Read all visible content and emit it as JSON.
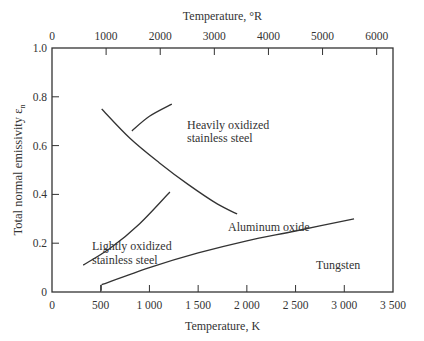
{
  "chart_data": {
    "type": "line",
    "title": "",
    "xlabel": "Temperature, K",
    "x2label": "Temperature, °R",
    "ylabel": "Total normal emissivity ε",
    "ylabel_sub": "n",
    "xlim": [
      0,
      3500
    ],
    "x2lim": [
      0,
      6300
    ],
    "ylim": [
      0,
      1.0
    ],
    "x_ticks": [
      0,
      500,
      1000,
      1500,
      2000,
      2500,
      3000,
      3500
    ],
    "x_tick_labels": [
      "0",
      "500",
      "1 000",
      "1 500",
      "2 000",
      "2 500",
      "3 000",
      "3 500"
    ],
    "x2_ticks": [
      0,
      1000,
      2000,
      3000,
      4000,
      5000,
      6000
    ],
    "x2_tick_labels": [
      "0",
      "1000",
      "2000",
      "3000",
      "4000",
      "5000",
      "6000"
    ],
    "y_ticks": [
      0,
      0.2,
      0.4,
      0.6,
      0.8,
      1.0
    ],
    "y_tick_labels": [
      "0",
      "0.2",
      "0.4",
      "0.6",
      "0.8",
      "1.0"
    ],
    "grid": false,
    "legend": "inline labels",
    "series": [
      {
        "name": "Aluminum oxide",
        "x": [
          510,
          800,
          1100,
          1400,
          1700,
          1900
        ],
        "y": [
          0.75,
          0.63,
          0.53,
          0.44,
          0.36,
          0.32
        ]
      },
      {
        "name": "Heavily oxidized stainless steel",
        "x": [
          820,
          1000,
          1230
        ],
        "y": [
          0.66,
          0.72,
          0.77
        ]
      },
      {
        "name": "Lightly oxidized stainless steel",
        "x": [
          320,
          600,
          900,
          1210
        ],
        "y": [
          0.11,
          0.18,
          0.28,
          0.41
        ]
      },
      {
        "name": "Tungsten",
        "x": [
          510,
          1000,
          1500,
          2000,
          2500,
          3100
        ],
        "y": [
          0.03,
          0.1,
          0.16,
          0.21,
          0.25,
          0.3
        ]
      }
    ],
    "annotations": [
      {
        "text": "Heavily oxidized",
        "line2": "stainless steel"
      },
      {
        "text": "Aluminum oxide"
      },
      {
        "text": "Lightly oxidized",
        "line2": "stainless steel"
      },
      {
        "text": "Tungsten"
      }
    ]
  }
}
